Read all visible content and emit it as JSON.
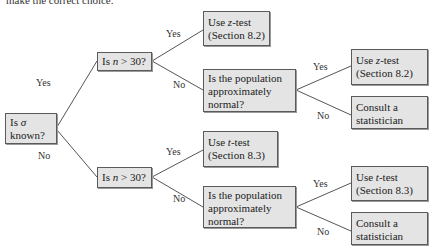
{
  "header": {
    "cut_text": "make the correct choice."
  },
  "nodes": {
    "root": {
      "line1_prefix": "Is ",
      "line1_symbol": "σ",
      "line2": "known?"
    },
    "n_top": {
      "prefix": "Is ",
      "var": "n",
      "suffix": " > 30?"
    },
    "n_bottom": {
      "prefix": "Is ",
      "var": "n",
      "suffix": " > 30?"
    },
    "z_top": {
      "prefix": "Use ",
      "var": "z",
      "suffix": "-test",
      "line2": "(Section 8.2)"
    },
    "pop_top": {
      "line1": "Is the population",
      "line2": "approximately",
      "line3": "normal?"
    },
    "z_right": {
      "prefix": "Use ",
      "var": "z",
      "suffix": "-test",
      "line2": "(Section 8.2)"
    },
    "consult_top": {
      "line1": "Consult a",
      "line2": "statistician"
    },
    "t_top": {
      "prefix": "Use ",
      "var": "t",
      "suffix": "-test",
      "line2": "(Section 8.3)"
    },
    "pop_bottom": {
      "line1": "Is the population",
      "line2": "approximately",
      "line3": "normal?"
    },
    "t_right": {
      "prefix": "Use ",
      "var": "t",
      "suffix": "-test",
      "line2": "(Section 8.3)"
    },
    "consult_bottom": {
      "line1": "Consult a",
      "line2": "statistician"
    }
  },
  "edge_labels": {
    "root_yes": "Yes",
    "root_no": "No",
    "n_top_yes": "Yes",
    "n_top_no": "No",
    "pop_top_yes": "Yes",
    "pop_top_no": "No",
    "n_bottom_yes": "Yes",
    "n_bottom_no": "No",
    "pop_bottom_yes": "Yes",
    "pop_bottom_no": "No"
  },
  "colors": {
    "box_fill": "#e4e4e4",
    "box_border": "#5a5a5a",
    "line": "#555555"
  }
}
